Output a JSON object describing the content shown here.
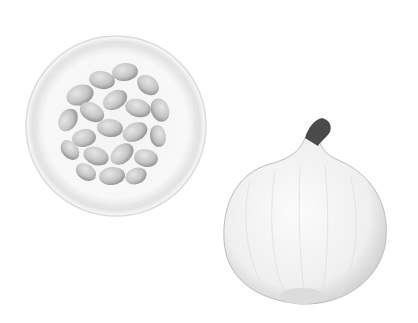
{
  "scene": {
    "description": "Photo of a glass bowl of white beans and a halved white onion on a white background",
    "background": "#ffffff",
    "objects": [
      {
        "name": "bowl-of-beans",
        "center": [
          116,
          126
        ],
        "radius": 90
      },
      {
        "name": "onion-half",
        "center": [
          312,
          228
        ],
        "width": 176,
        "height": 180
      }
    ]
  }
}
